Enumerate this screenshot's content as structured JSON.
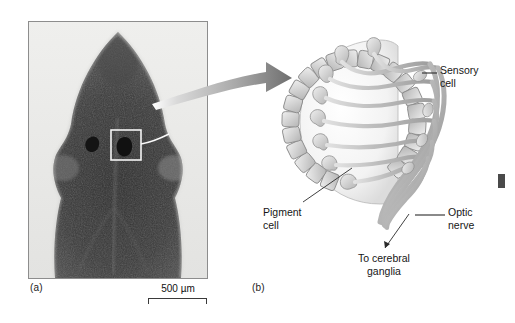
{
  "figure": {
    "type": "scientific-figure",
    "background_color": "#ffffff",
    "text_color": "#161616"
  },
  "panel_a": {
    "caption": "(a)",
    "content": "light micrograph of planarian head showing paired eyespots",
    "highlight_box": "white square outlining right eyespot",
    "scale_bar": {
      "label": "500 µm",
      "value": 500,
      "unit": "µm"
    }
  },
  "panel_b": {
    "caption": "(b)",
    "content": "schematic cross-section of pigment-cup eye (ocellus)",
    "labels": [
      {
        "id": "sensory-cell",
        "text": "Sensory\ncell"
      },
      {
        "id": "optic-nerve",
        "text": "Optic\nnerve"
      },
      {
        "id": "pigment-cell",
        "text": "Pigment\ncell"
      },
      {
        "id": "to-cerebral-ganglia",
        "text": "To cerebral\nganglia"
      }
    ]
  },
  "colors": {
    "frame": "#8d8d8d",
    "arrow": "#9a9a9a",
    "diagram_stroke": "#8a8a8a",
    "diagram_fill": "#d8d8d8",
    "cup_fill": "#f2f2f2"
  }
}
